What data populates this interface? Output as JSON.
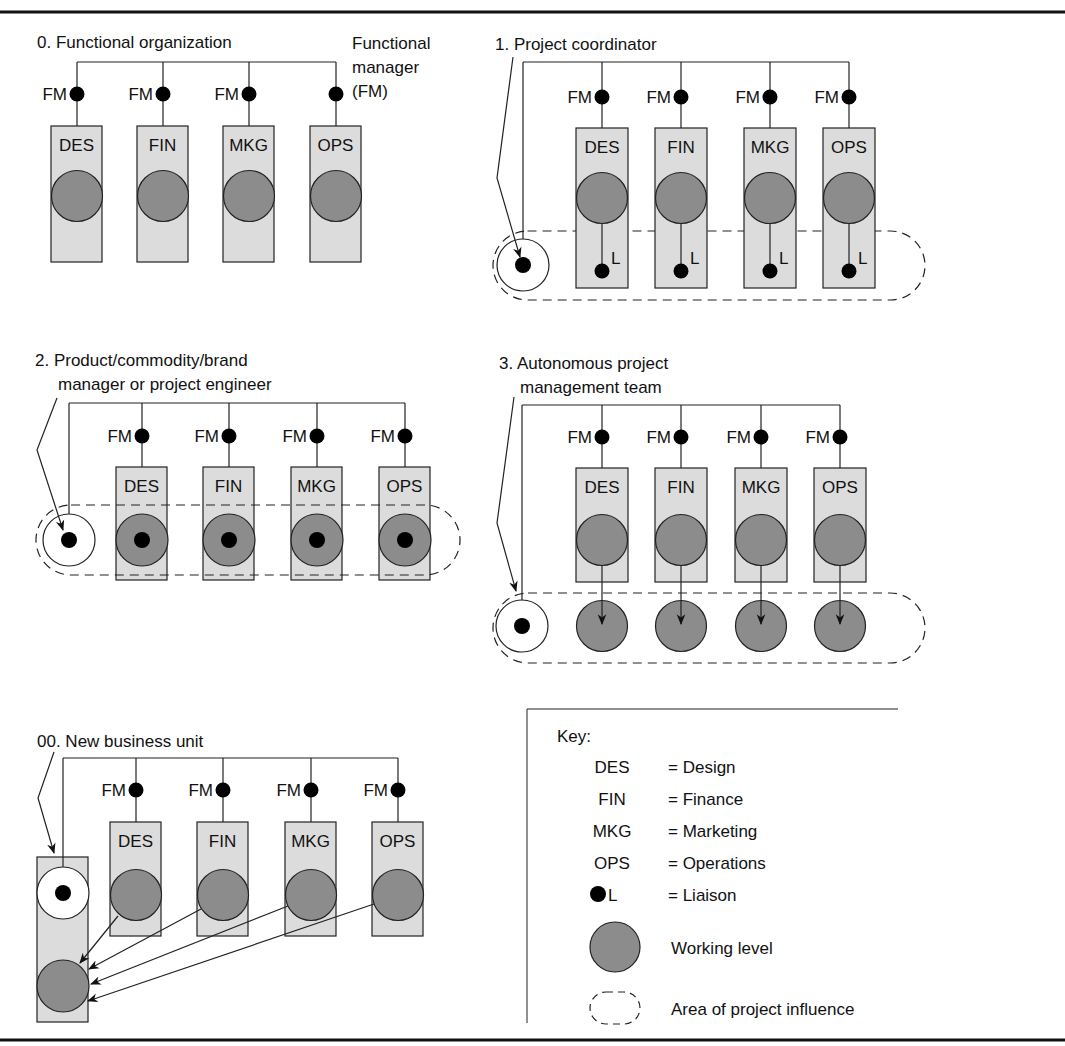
{
  "figure": {
    "colors": {
      "box_fill": "#dcdcdc",
      "working_fill": "#8c8c8c",
      "line": "#222222",
      "dot": "#000000",
      "rule": "#111111"
    },
    "fm_label": "FM",
    "liaison_label": "L",
    "units": [
      "DES",
      "FIN",
      "MKG",
      "OPS"
    ]
  },
  "panels": [
    {
      "id": "p0",
      "title_lines": [
        "0. Functional organization"
      ],
      "annotation_lines": [
        "Functional",
        "manager",
        "(FM)"
      ]
    },
    {
      "id": "p1",
      "title_lines": [
        "1. Project coordinator"
      ]
    },
    {
      "id": "p2",
      "title_lines": [
        "2. Product/commodity/brand",
        "manager or project engineer"
      ]
    },
    {
      "id": "p3",
      "title_lines": [
        "3. Autonomous project",
        "management team"
      ]
    },
    {
      "id": "p00",
      "title_lines": [
        "00. New business unit"
      ]
    }
  ],
  "key": {
    "title": "Key:",
    "entries": [
      {
        "symbol": "DES",
        "meaning": "= Design"
      },
      {
        "symbol": "FIN",
        "meaning": "= Finance"
      },
      {
        "symbol": "MKG",
        "meaning": "= Marketing"
      },
      {
        "symbol": "OPS",
        "meaning": "= Operations"
      },
      {
        "symbol": "L",
        "symbol_icon": "liaison-dot",
        "meaning": "= Liaison"
      }
    ],
    "working_level": "Working level",
    "influence": "Area of project influence"
  }
}
